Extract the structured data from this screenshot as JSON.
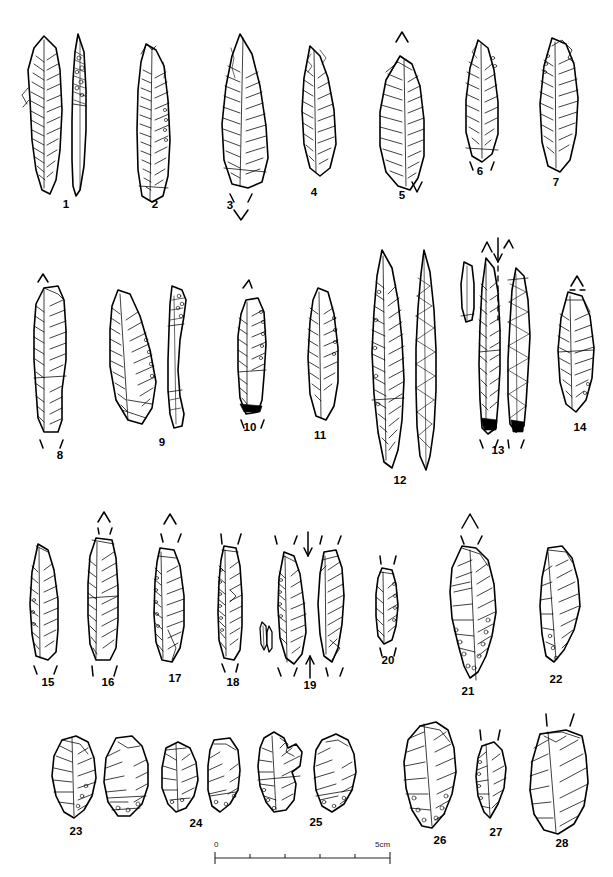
{
  "plate": {
    "width": 613,
    "height": 877,
    "background_color": "#ffffff",
    "ink_color": "#000000",
    "partial_header_text": "• • • • • • • • •",
    "description": "Archaeological plate of 28 chipped stone artefacts (blades, points, bladelets, burins and cores) drawn in ink line-and-hatch technique, arranged in four rows above a linear scale bar."
  },
  "scale_bar": {
    "name": "scale-bar",
    "start_label": "0",
    "end_label": "5cm",
    "divisions": 5,
    "unit": "cm",
    "total_length_cm": 5,
    "x_start_px": 215,
    "x_end_px": 390,
    "y_px": 858
  },
  "figures": [
    {
      "number": "1",
      "label_x": 66,
      "label_y": 205,
      "views": 2,
      "type": "bifacial-point"
    },
    {
      "number": "2",
      "label_x": 155,
      "label_y": 205,
      "views": 1,
      "type": "backed-blade"
    },
    {
      "number": "3",
      "label_x": 230,
      "label_y": 206,
      "views": 1,
      "type": "retouched-blade"
    },
    {
      "number": "4",
      "label_x": 314,
      "label_y": 193,
      "views": 1,
      "type": "pointed-blade"
    },
    {
      "number": "5",
      "label_x": 402,
      "label_y": 196,
      "views": 1,
      "type": "retouched-point"
    },
    {
      "number": "6",
      "label_x": 480,
      "label_y": 172,
      "views": 1,
      "type": "blade-fragment"
    },
    {
      "number": "7",
      "label_x": 556,
      "label_y": 183,
      "views": 1,
      "type": "retouched-blade"
    },
    {
      "number": "8",
      "label_x": 60,
      "label_y": 456,
      "views": 1,
      "type": "truncated-blade"
    },
    {
      "number": "9",
      "label_x": 162,
      "label_y": 443,
      "views": 2,
      "type": "backed-blade"
    },
    {
      "number": "10",
      "label_x": 250,
      "label_y": 428,
      "views": 1,
      "type": "blade-fragment"
    },
    {
      "number": "11",
      "label_x": 320,
      "label_y": 436,
      "views": 1,
      "type": "narrow-blade"
    },
    {
      "number": "12",
      "label_x": 400,
      "label_y": 481,
      "views": 2,
      "type": "long-bipointed-blade"
    },
    {
      "number": "13",
      "label_x": 498,
      "label_y": 451,
      "views": 3,
      "type": "backed-bladelet"
    },
    {
      "number": "14",
      "label_x": 580,
      "label_y": 428,
      "views": 1,
      "type": "retouched-blade"
    },
    {
      "number": "15",
      "label_x": 48,
      "label_y": 683,
      "views": 1,
      "type": "bladelet"
    },
    {
      "number": "16",
      "label_x": 108,
      "label_y": 683,
      "views": 1,
      "type": "truncated-bladelet"
    },
    {
      "number": "17",
      "label_x": 175,
      "label_y": 679,
      "views": 1,
      "type": "backed-bladelet"
    },
    {
      "number": "18",
      "label_x": 233,
      "label_y": 683,
      "views": 1,
      "type": "backed-bladelet"
    },
    {
      "number": "19",
      "label_x": 310,
      "label_y": 686,
      "views": 2,
      "type": "bladelet"
    },
    {
      "number": "20",
      "label_x": 388,
      "label_y": 661,
      "views": 1,
      "type": "bladelet-fragment"
    },
    {
      "number": "21",
      "label_x": 468,
      "label_y": 692,
      "views": 1,
      "type": "large-retouched-point"
    },
    {
      "number": "22",
      "label_x": 556,
      "label_y": 680,
      "views": 1,
      "type": "retouched-flake"
    },
    {
      "number": "23",
      "label_x": 76,
      "label_y": 832,
      "views": 2,
      "type": "bladelet-core"
    },
    {
      "number": "24",
      "label_x": 196,
      "label_y": 824,
      "views": 2,
      "type": "bladelet-core"
    },
    {
      "number": "25",
      "label_x": 316,
      "label_y": 823,
      "views": 2,
      "type": "burin"
    },
    {
      "number": "26",
      "label_x": 440,
      "label_y": 841,
      "views": 1,
      "type": "core-fragment"
    },
    {
      "number": "27",
      "label_x": 496,
      "label_y": 833,
      "views": 1,
      "type": "small-burin"
    },
    {
      "number": "28",
      "label_x": 562,
      "label_y": 844,
      "views": 1,
      "type": "core"
    }
  ]
}
